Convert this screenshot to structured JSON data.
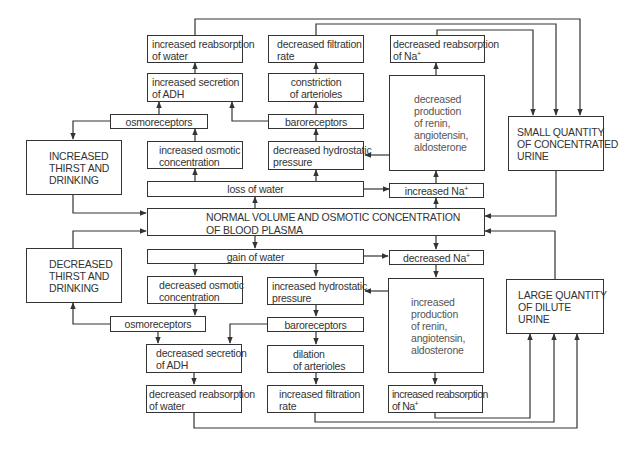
{
  "diagram": {
    "center": {
      "lines": [
        "NORMAL VOLUME AND OSMOTIC CONCENTRATION",
        "OF BLOOD PLASMA"
      ]
    },
    "water_loss_branch": {
      "trigger": "loss of water",
      "osmotic": {
        "increased_osmotic_concentration": [
          "increased  osmotic",
          "concentration"
        ],
        "osmoreceptors": "osmoreceptors",
        "increased_secretion_adh": [
          "increased secretion",
          "of ADH"
        ],
        "increased_reabsorption_water": [
          "increased reabsorption",
          "of water"
        ],
        "thirst": [
          "INCREASED",
          "THIRST AND",
          "DRINKING"
        ]
      },
      "pressure": {
        "decreased_hydrostatic_pressure": [
          "decreased  hydrostatic",
          "pressure"
        ],
        "baroreceptors": "baroreceptors",
        "constriction_arterioles": [
          "constriction",
          "of arterioles"
        ],
        "decreased_filtration_rate": [
          "decreased filtration",
          "rate"
        ]
      },
      "sodium": {
        "increased_na": "increased Na",
        "renin": [
          "decreased",
          "production",
          "of renin,",
          "angiotensin,",
          "aldosterone"
        ],
        "decreased_reabsorption_na": [
          "decreased reabsorption",
          "of Na"
        ]
      },
      "outcome": [
        "SMALL QUANTITY",
        "OF CONCENTRATED",
        "URINE"
      ]
    },
    "water_gain_branch": {
      "trigger": "gain of water",
      "osmotic": {
        "decreased_osmotic_concentration": [
          "decreased osmotic",
          "concentration"
        ],
        "osmoreceptors": "osmoreceptors",
        "decreased_secretion_adh": [
          "decreased secretion",
          "of ADH"
        ],
        "decreased_reabsorption_water": [
          "decreased reabsorption",
          "of water"
        ],
        "thirst": [
          "DECREASED",
          "THIRST AND",
          "DRINKING"
        ]
      },
      "pressure": {
        "increased_hydrostatic_pressure": [
          "increased hydrostatic",
          "pressure"
        ],
        "baroreceptors": "baroreceptors",
        "dilation_arterioles": [
          "dilation",
          "of arterioles"
        ],
        "increased_filtration_rate": [
          "increased filtration",
          "rate"
        ]
      },
      "sodium": {
        "decreased_na": "decreased Na",
        "renin": [
          "increased",
          "production",
          "of renin,",
          "angiotensin,",
          "aldosterone"
        ],
        "increased_reabsorption_na": [
          "increased reabsorption",
          "of Na"
        ]
      },
      "outcome": [
        "LARGE QUANTITY",
        "OF DILUTE",
        "URINE"
      ]
    },
    "superscript_plus": "+",
    "colors": {
      "line": "#333333",
      "text": "#333333",
      "background": "#ffffff"
    }
  }
}
